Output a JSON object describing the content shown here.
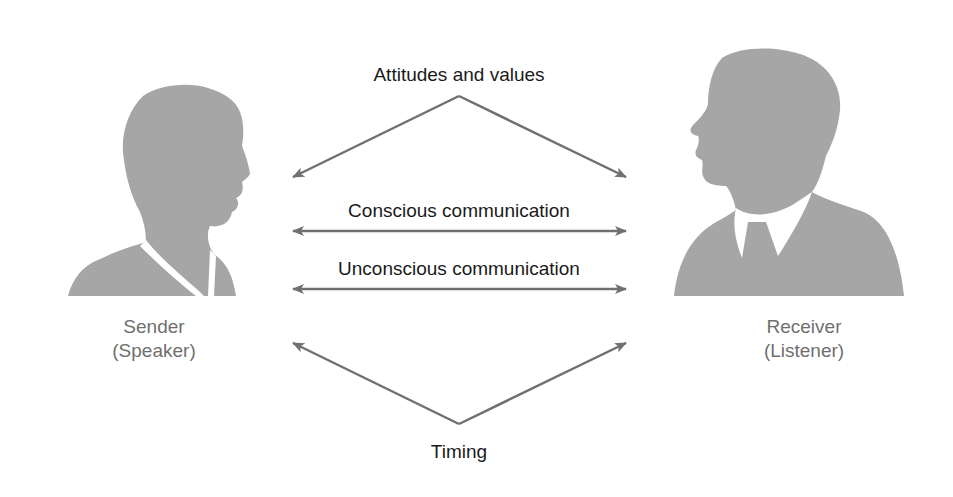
{
  "diagram": {
    "type": "communication-model",
    "colors": {
      "silhouette": "#a6a6a6",
      "arrow": "#707070",
      "label_text": "#1a1a1a",
      "person_label_text": "#6f6f6f",
      "background": "#ffffff"
    },
    "sender": {
      "title": "Sender",
      "subtitle": "(Speaker)",
      "icon": "person-silhouette-left-female-icon"
    },
    "receiver": {
      "title": "Receiver",
      "subtitle": "(Listener)",
      "icon": "person-silhouette-right-male-icon"
    },
    "connections": [
      {
        "label": "Attitudes and values",
        "shape": "inverted-v",
        "direction": "from-top-apex-to-both"
      },
      {
        "label": "Conscious communication",
        "shape": "line",
        "direction": "bidirectional"
      },
      {
        "label": "Unconscious communication",
        "shape": "line",
        "direction": "bidirectional"
      },
      {
        "label": "Timing",
        "shape": "v",
        "direction": "from-bottom-apex-to-both"
      }
    ]
  }
}
